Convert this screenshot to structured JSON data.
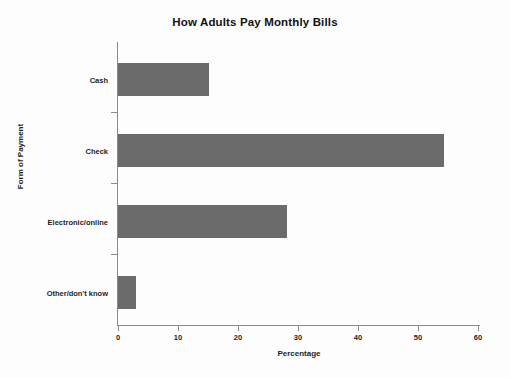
{
  "chart_data": {
    "type": "bar",
    "orientation": "horizontal",
    "title": "How Adults Pay Monthly Bills",
    "xlabel": "Percentage",
    "ylabel": "Form of Payment",
    "categories": [
      "Cash",
      "Check",
      "Electronic/online",
      "Other/don't know"
    ],
    "values": [
      15,
      54,
      28,
      3
    ],
    "xlim": [
      0,
      60
    ],
    "xticks": [
      0,
      10,
      20,
      30,
      40,
      50,
      60
    ],
    "xtick_labels": [
      "0",
      "10",
      "20",
      "30",
      "40",
      "50",
      "60"
    ],
    "grid": false,
    "legend": false,
    "bar_color": "#6b6b6b",
    "axis_color": "#8a8a8a",
    "background": "#fdfdfd"
  }
}
